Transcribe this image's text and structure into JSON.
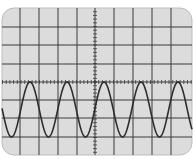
{
  "oscilloscope": {
    "screen": {
      "x": 2,
      "y": 8,
      "width": 190,
      "height": 147,
      "corner_radius": 12,
      "background": "#dcdcdc",
      "border": "#bdbdbd"
    },
    "grid": {
      "color": "#3a3a3a",
      "vertical_lines_x": [
        20,
        39,
        58,
        77,
        114,
        133,
        152,
        171
      ],
      "horizontal_lines_y": [
        27,
        45,
        64,
        100,
        118,
        137
      ],
      "center_x": 95,
      "center_y": 82,
      "minor_tick_spacing": 3.7,
      "divisions": {
        "horizontal": 10,
        "vertical": 8
      }
    },
    "trace": {
      "color": "#2e2e2e",
      "waveform": "sine",
      "peak_y": 82,
      "trough_y": 137,
      "period_px": 37,
      "peaks_x": [
        30,
        67,
        104,
        141,
        178
      ],
      "troughs_x": [
        12,
        49,
        86,
        123,
        160
      ],
      "cycles_visible": 5
    }
  }
}
